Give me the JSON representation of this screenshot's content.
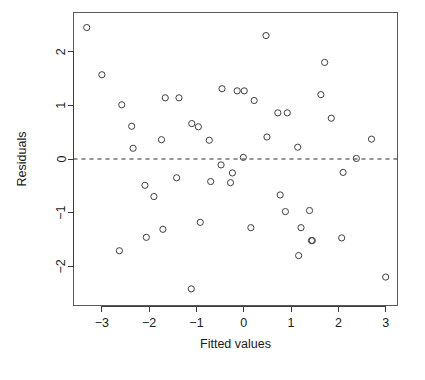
{
  "chart_data": {
    "type": "scatter",
    "title": "",
    "xlabel": "Fitted values",
    "ylabel": "Residuals",
    "xlim": [
      -3.6,
      3.25
    ],
    "ylim": [
      -2.73,
      2.73
    ],
    "xticks": [
      -3,
      -2,
      -1,
      0,
      1,
      2,
      3
    ],
    "xticklabels": [
      "−3",
      "−2",
      "−1",
      "0",
      "1",
      "2",
      "3"
    ],
    "yticks": [
      -2,
      -1,
      0,
      1,
      2
    ],
    "yticklabels": [
      "−2",
      "−1",
      "0",
      "1",
      "2"
    ],
    "grid": false,
    "legend": null,
    "marker": "open-circle",
    "marker_color": "#3f3f3f",
    "reference_lines": [
      {
        "name": "zero-residual-line",
        "orientation": "horizontal",
        "y": 0,
        "style": "dashed",
        "color": "#2b2b2b"
      }
    ],
    "x": [
      -3.32,
      -3.0,
      -2.63,
      -2.58,
      -2.37,
      -2.34,
      -2.09,
      -2.06,
      -1.9,
      -1.74,
      -1.71,
      -1.66,
      -1.42,
      -1.37,
      -1.11,
      -1.1,
      -0.96,
      -0.92,
      -0.73,
      -0.7,
      -0.48,
      -0.46,
      -0.28,
      -0.24,
      -0.14,
      -0.01,
      0.01,
      0.15,
      0.22,
      0.47,
      0.49,
      0.72,
      0.77,
      0.88,
      0.92,
      1.14,
      1.16,
      1.21,
      1.39,
      1.43,
      1.45,
      1.63,
      1.71,
      1.85,
      2.07,
      2.1,
      2.38,
      2.7,
      3.0
    ],
    "y": [
      2.45,
      1.57,
      -1.71,
      1.01,
      0.61,
      0.2,
      -0.49,
      -1.46,
      -0.7,
      0.36,
      -1.31,
      1.14,
      -0.35,
      1.14,
      -2.42,
      0.66,
      0.6,
      -1.18,
      0.35,
      -0.42,
      -0.11,
      1.31,
      -0.44,
      -0.26,
      1.27,
      0.03,
      1.27,
      -1.28,
      1.09,
      2.3,
      0.41,
      0.86,
      -0.67,
      -0.98,
      0.86,
      0.22,
      -1.8,
      -1.28,
      -0.96,
      -1.52,
      -1.52,
      1.2,
      1.8,
      0.76,
      -1.47,
      -0.25,
      0.01,
      0.37,
      -2.2
    ]
  },
  "labels": {
    "y_axis_title": "Residuals",
    "x_axis_title": "Fitted values"
  }
}
